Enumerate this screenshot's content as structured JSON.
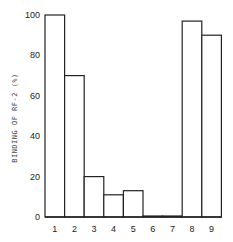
{
  "chart_data": {
    "type": "bar",
    "title": "",
    "xlabel": "",
    "ylabel": "BINDING OF RF-2 (%)",
    "categories": [
      "1",
      "2",
      "3",
      "4",
      "5",
      "6",
      "7",
      "8",
      "9"
    ],
    "values": [
      100,
      70,
      20,
      11,
      13,
      0.5,
      0.5,
      97,
      90
    ],
    "ylim": [
      0,
      100
    ],
    "yticks": [
      0,
      20,
      40,
      60,
      80,
      100
    ],
    "grid": false,
    "legend": null,
    "colors": {
      "bar_fill": "#ffffff",
      "bar_stroke": "#222222",
      "axis": "#222222"
    }
  }
}
